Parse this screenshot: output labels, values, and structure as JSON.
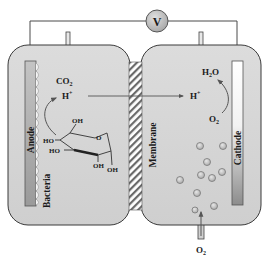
{
  "diagram": {
    "voltmeter": {
      "label": "V"
    },
    "anode_chamber": {
      "electrode_label": "Anode",
      "biofilm_label": "Bacteria",
      "products": {
        "co2": "CO",
        "co2_sub": "2",
        "proton": "H",
        "proton_sup": "+"
      },
      "substrate": {
        "name": "glucose",
        "groups": [
          "OH",
          "HO",
          "HO",
          "O",
          "OH",
          "OH"
        ]
      }
    },
    "membrane": {
      "label": "Membrane"
    },
    "cathode_chamber": {
      "electrode_label": "Cathode",
      "proton": {
        "text": "H",
        "sup": "+"
      },
      "water": {
        "text": "H",
        "sub": "2",
        "tail": "O"
      },
      "oxygen": {
        "text": "O",
        "sub": "2"
      },
      "inlet": {
        "text": "O",
        "sub": "2"
      }
    },
    "colors": {
      "chamber_fill": "#d6d6d6",
      "outline": "#3a3a3a",
      "wire": "#4a4a4a",
      "voltmeter_fill": "#b8b8b8",
      "bubble_fill": "#bdbdbd",
      "anode_fill": "#a8a8a8",
      "cathode_top": "#ffffff",
      "cathode_bottom": "#8a8a8a"
    }
  }
}
